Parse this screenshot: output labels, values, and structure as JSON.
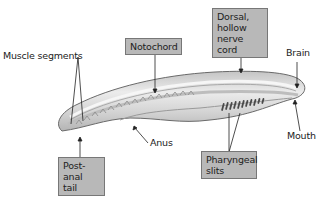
{
  "diagram": {
    "labels": {
      "muscle_segments": "Muscle segments",
      "notochord": "Notochord",
      "dorsal_nerve_cord_line1": "Dorsal,",
      "dorsal_nerve_cord_line2": "hollow",
      "dorsal_nerve_cord_line3": "nerve cord",
      "brain": "Brain",
      "mouth": "Mouth",
      "anus": "Anus",
      "post_anal_tail_line1": "Post-anal",
      "post_anal_tail_line2": "tail",
      "pharyngeal_slits_line1": "Pharyngeal",
      "pharyngeal_slits_line2": "slits"
    },
    "boxed_labels": [
      "Notochord",
      "Dorsal, hollow nerve cord",
      "Post-anal tail",
      "Pharyngeal slits"
    ],
    "plain_labels": [
      "Muscle segments",
      "Brain",
      "Anus",
      "Mouth"
    ],
    "colors": {
      "box_fill": "#b8b8b8",
      "box_border": "#777777",
      "body_fill": "#d4d4d4",
      "body_outline": "#6a6a6a",
      "slit_color": "#4a4a4a",
      "text": "#222222"
    }
  }
}
